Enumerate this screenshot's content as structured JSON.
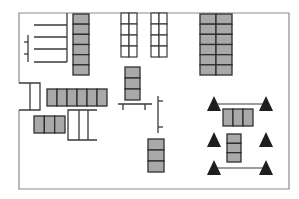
{
  "diagram": {
    "type": "floor-plan",
    "colors": {
      "background": "#ffffff",
      "wall": "#8c8c8c",
      "line": "#3a3a3a",
      "shelf_fill": "#a9a9a9",
      "shelf_divider": "#2e2e2e",
      "marker": "#1e1e1e"
    },
    "elements": [
      {
        "kind": "rack-comb",
        "name": "coat-rack-comb",
        "arms": 4
      },
      {
        "kind": "shelf-column",
        "name": "shelf-column-top-left",
        "cells": 6,
        "columns": 1
      },
      {
        "kind": "grid-rack",
        "name": "open-rack-left",
        "rows": 4,
        "columns": 2
      },
      {
        "kind": "grid-rack",
        "name": "open-rack-right",
        "rows": 4,
        "columns": 2
      },
      {
        "kind": "shelf-column",
        "name": "shelf-stack-center",
        "cells": 3,
        "columns": 1
      },
      {
        "kind": "shelf-column",
        "name": "shelf-block-top-right",
        "cells": 6,
        "columns": 2
      },
      {
        "kind": "open-box",
        "name": "open-cabinet-left",
        "cells": 2
      },
      {
        "kind": "shelf-row",
        "name": "shelf-row-middle",
        "cells": 6
      },
      {
        "kind": "shelf-row",
        "name": "shelf-row-lower-left",
        "cells": 3
      },
      {
        "kind": "bracket",
        "name": "bracket-unit-lower",
        "dividers": 2
      },
      {
        "kind": "table",
        "name": "bench-center",
        "legs": 2
      },
      {
        "kind": "post",
        "name": "post-center-right",
        "ticks": 2
      },
      {
        "kind": "shelf-column",
        "name": "shelf-stack-lower-center",
        "cells": 3,
        "columns": 1
      },
      {
        "kind": "marker-set",
        "name": "triangle-markers",
        "count": 6
      },
      {
        "kind": "shelf-row",
        "name": "shelf-row-right",
        "cells": 3
      },
      {
        "kind": "shelf-column",
        "name": "shelf-stack-right",
        "cells": 3,
        "columns": 1
      }
    ]
  }
}
